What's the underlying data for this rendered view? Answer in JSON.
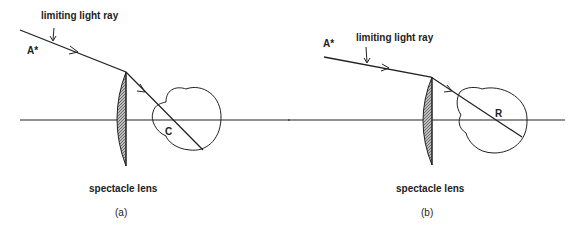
{
  "figure": {
    "panel_a": {
      "ray_label": "limiting light ray",
      "point_label": "A*",
      "center_label": "C",
      "lens_label": "spectacle lens",
      "caption": "(a)"
    },
    "panel_b": {
      "ray_label": "limiting light ray",
      "point_label": "A*",
      "center_label": "R",
      "lens_label": "spectacle lens",
      "caption": "(b)"
    },
    "colors": {
      "line": "#222222",
      "lens_fill": "#9a9a9a",
      "background": "#ffffff"
    }
  }
}
